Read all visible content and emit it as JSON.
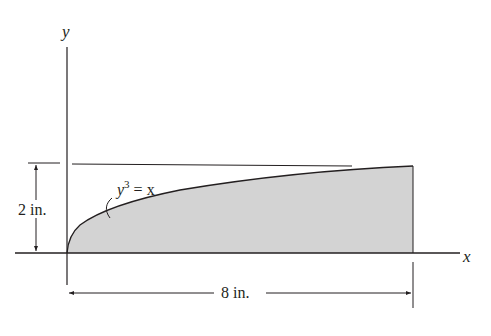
{
  "diagram": {
    "axes": {
      "x_label": "x",
      "y_label": "y"
    },
    "curve": {
      "equation_base": "y",
      "equation_exponent": "3",
      "equation_rest": " = x"
    },
    "dimensions": {
      "height_label": "2 in.",
      "width_label": "8 in."
    },
    "colors": {
      "fill": "#d3d3d3",
      "stroke": "#231f20"
    }
  }
}
